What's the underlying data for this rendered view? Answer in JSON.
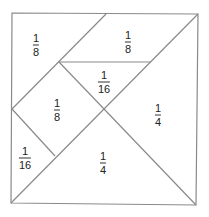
{
  "diagram": {
    "type": "tangram-fraction-square",
    "line_color": "#8a8a8a",
    "pieces": [
      {
        "id": "top-left-triangle",
        "numerator": "1",
        "denominator": "8",
        "x": 36,
        "y": 45
      },
      {
        "id": "top-parallelogram",
        "numerator": "1",
        "denominator": "8",
        "x": 128,
        "y": 42
      },
      {
        "id": "middle-small-triangle",
        "numerator": "1",
        "denominator": "16",
        "x": 104,
        "y": 82
      },
      {
        "id": "left-square",
        "numerator": "1",
        "denominator": "8",
        "x": 57,
        "y": 110
      },
      {
        "id": "right-large-triangle",
        "numerator": "1",
        "denominator": "4",
        "x": 158,
        "y": 115
      },
      {
        "id": "bottom-left-small-triangle",
        "numerator": "1",
        "denominator": "16",
        "x": 25,
        "y": 158
      },
      {
        "id": "bottom-large-triangle",
        "numerator": "1",
        "denominator": "4",
        "x": 103,
        "y": 163
      }
    ]
  }
}
